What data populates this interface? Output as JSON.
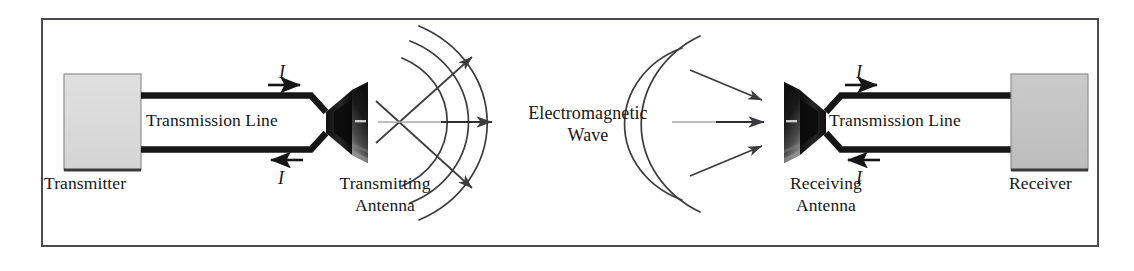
{
  "figure": {
    "type": "schematic-diagram",
    "frame_border_color": "#4a4a52",
    "background_color": "#ffffff",
    "ink_color": "#161616"
  },
  "transmit_side": {
    "source_box": {
      "label": "Transmitter",
      "fill_color": "#dcdcdc",
      "border_color": "#8a8a8a"
    },
    "feed_line": {
      "label": "Transmission Line",
      "conductor_color": "#161616"
    },
    "current_top": {
      "symbol": "I",
      "arrow_direction": "right"
    },
    "current_bottom": {
      "symbol": "I",
      "arrow_direction": "left"
    },
    "antenna": {
      "label_line1": "Transmitting",
      "label_line2": "Antenna",
      "fill_color": "#1c1c1c"
    }
  },
  "propagation": {
    "label_line1": "Electromagnetic",
    "label_line2": "Wave",
    "wavefront_count_transmit": 3,
    "wavefront_count_receive": 2,
    "ray_color": "#3b3b40",
    "axis_color": "#9a9aa0"
  },
  "receive_side": {
    "antenna": {
      "label_line1": "Receiving",
      "label_line2": "Antenna",
      "fill_color": "#1c1c1c"
    },
    "current_top": {
      "symbol": "I",
      "arrow_direction": "right"
    },
    "current_bottom": {
      "symbol": "I",
      "arrow_direction": "left"
    },
    "feed_line": {
      "label": "Transmission Line",
      "conductor_color": "#161616"
    },
    "sink_box": {
      "label": "Receiver",
      "fill_color": "#c4c4c4",
      "border_color": "#8a8a8a"
    }
  }
}
